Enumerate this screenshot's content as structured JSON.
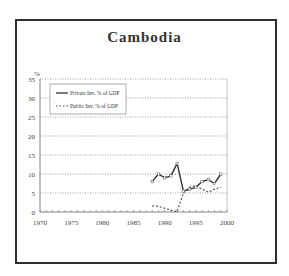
{
  "chart_data": {
    "type": "line",
    "title": "Cambodia",
    "xlabel": "",
    "ylabel": "%",
    "xlim": [
      1970,
      2000
    ],
    "ylim": [
      0,
      35
    ],
    "x_ticks": [
      1970,
      1975,
      1980,
      1985,
      1990,
      1995,
      2000
    ],
    "y_ticks": [
      0,
      5,
      10,
      15,
      20,
      25,
      30,
      35
    ],
    "grid": "horizontal dotted",
    "legend_position": "upper left",
    "x": [
      1988,
      1989,
      1990,
      1991,
      1992,
      1993,
      1994,
      1995,
      1996,
      1997,
      1998,
      1999
    ],
    "series": [
      {
        "name": "Private Inv. % of GDP",
        "style": "solid with markers",
        "values": [
          8,
          10,
          9,
          9.5,
          12.8,
          5.5,
          6,
          6.5,
          8,
          8.5,
          7.5,
          10
        ]
      },
      {
        "name": "Public Inv. % of GDP",
        "style": "dotted",
        "values": [
          1.6,
          1.5,
          1,
          0.5,
          0.1,
          5,
          6.5,
          7,
          6,
          5.2,
          6,
          6.5
        ]
      }
    ]
  },
  "labels": {
    "title": "Cambodia",
    "y_unit": "%",
    "legend_private": "Private Inv. % of GDP",
    "legend_public": "Public Inv. % of GDP"
  }
}
